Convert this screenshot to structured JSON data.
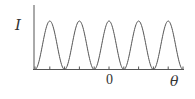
{
  "chart_data": {
    "type": "line",
    "title": "",
    "xlabel": "θ",
    "ylabel": "I",
    "x_tick_labels": [
      "0"
    ],
    "grid": false,
    "legend": null,
    "series": [
      {
        "name": "intensity",
        "description": "periodic cos^2-like intensity pattern with 5 equal peaks",
        "peak_count": 5,
        "peaks_x_px": [
          49,
          79,
          109,
          138,
          167
        ],
        "minima_x_px": [
          35,
          65,
          95,
          124,
          154,
          183
        ],
        "peak_value": 1.0,
        "min_value": 0.0
      }
    ],
    "colors": {
      "curve": "#444444",
      "axis": "#444444"
    }
  },
  "labels": {
    "y_axis": "I",
    "x_axis": "θ",
    "origin_tick": "0"
  }
}
